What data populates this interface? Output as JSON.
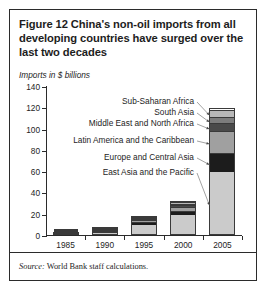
{
  "figure": {
    "title": "Figure 12  China's non-oil imports from all developing countries have surged over the last two decades",
    "subtitle": "Imports in $ billions",
    "source_label": "Source:",
    "source_text": " World Bank staff calculations."
  },
  "chart_data": {
    "type": "bar",
    "stacked": true,
    "title": "Figure 12  China's non-oil imports from all developing countries have surged over the last two decades",
    "subtitle": "Imports in $ billions",
    "xlabel": "",
    "ylabel": "Imports in $ billions",
    "ylim": [
      0,
      140
    ],
    "yticks": [
      0,
      20,
      40,
      60,
      80,
      100,
      120,
      140
    ],
    "categories": [
      "1985",
      "1990",
      "1995",
      "2000",
      "2005"
    ],
    "grid": false,
    "legend_position": "annotated-callouts",
    "series": [
      {
        "name": "East Asia and the Pacific",
        "color": "#cbcbcb",
        "values": [
          0.6,
          3.0,
          9.0,
          17.5,
          58.0
        ]
      },
      {
        "name": "Europe and Central Asia",
        "color": "#1c1c1c",
        "values": [
          0.2,
          1.0,
          2.5,
          4.0,
          18.0
        ]
      },
      {
        "name": "Latin America and the Caribbean",
        "color": "#a0a0a0",
        "values": [
          0.2,
          0.7,
          2.0,
          4.0,
          21.0
        ]
      },
      {
        "name": "Middle East and North Africa",
        "color": "#4a4a4a",
        "values": [
          0.1,
          0.4,
          1.0,
          1.5,
          7.0
        ]
      },
      {
        "name": "South Asia",
        "color": "#7d7d7d",
        "values": [
          0.1,
          0.4,
          1.0,
          1.5,
          6.0
        ]
      },
      {
        "name": "Sub-Saharan Africa",
        "color": "#b8b8b8",
        "values": [
          0.1,
          0.3,
          0.8,
          1.5,
          7.0
        ]
      }
    ],
    "totals": [
      1.3,
      5.8,
      16.3,
      30.0,
      117.0
    ],
    "annotations": [
      {
        "label": "Sub-Saharan Africa",
        "series": "Sub-Saharan Africa"
      },
      {
        "label": "South Asia",
        "series": "South Asia"
      },
      {
        "label": "Middle East and North Africa",
        "series": "Middle East and North Africa"
      },
      {
        "label": "Latin America and the Caribbean",
        "series": "Latin America and the Caribbean"
      },
      {
        "label": "Europe and Central Asia",
        "series": "Europe and Central Asia"
      },
      {
        "label": "East Asia and the Pacific",
        "series": "East Asia and the Pacific"
      }
    ]
  }
}
